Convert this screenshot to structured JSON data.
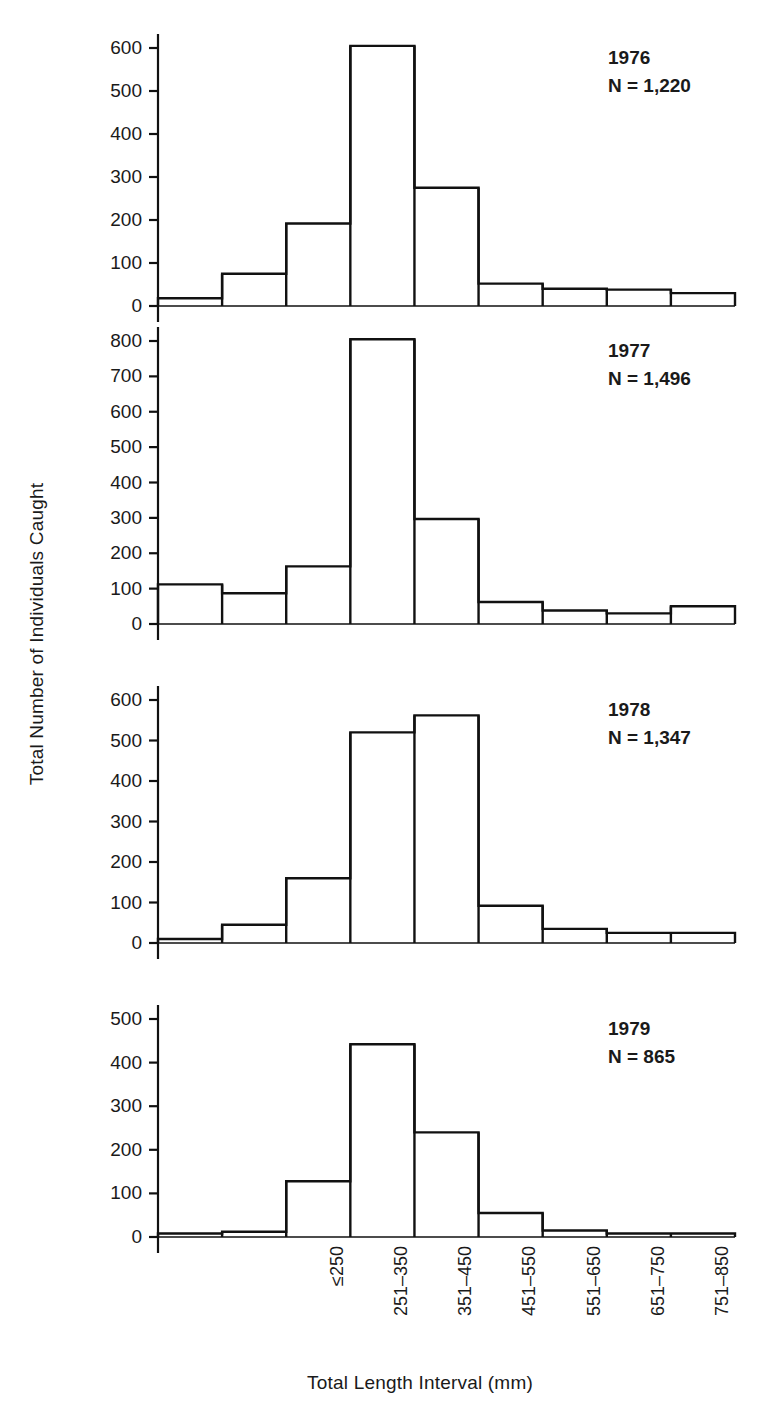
{
  "figure": {
    "xlabel": "Total Length Interval (mm)",
    "ylabel": "Total Number of Individuals Caught",
    "background": "#ffffff",
    "line_color": "#111111"
  },
  "chart_data": {
    "type": "bar",
    "title": "",
    "xlabel": "Total Length Interval (mm)",
    "ylabel": "Total Number of Individuals Caught",
    "grid": false,
    "legend": "none",
    "categories": [
      "≤250",
      "251–350",
      "351–450",
      "451–550",
      "551–650",
      "651–750",
      "751–850",
      "851–950",
      "≥951"
    ],
    "panels": [
      {
        "year": "1976",
        "n_label": "N = 1,220",
        "values": [
          18,
          75,
          192,
          605,
          275,
          52,
          40,
          38,
          30
        ],
        "ylim": [
          0,
          640
        ],
        "yticks": [
          0,
          100,
          200,
          300,
          400,
          500,
          600
        ],
        "ytick_labels": [
          "0",
          "100",
          "200",
          "300",
          "400",
          "500",
          "600"
        ]
      },
      {
        "year": "1977",
        "n_label": "N = 1,496",
        "values": [
          112,
          87,
          163,
          805,
          297,
          62,
          38,
          30,
          50
        ],
        "ylim": [
          0,
          850
        ],
        "yticks": [
          0,
          100,
          200,
          300,
          400,
          500,
          600,
          700,
          800
        ],
        "ytick_labels": [
          "0",
          "100",
          "200",
          "300",
          "400",
          "500",
          "600",
          "700",
          "800"
        ]
      },
      {
        "year": "1978",
        "n_label": "N = 1,347",
        "values": [
          10,
          45,
          160,
          520,
          562,
          92,
          35,
          25,
          25
        ],
        "ylim": [
          0,
          640
        ],
        "yticks": [
          0,
          100,
          200,
          300,
          400,
          500,
          600
        ],
        "ytick_labels": [
          "0",
          "100",
          "200",
          "300",
          "400",
          "500",
          "600"
        ]
      },
      {
        "year": "1979",
        "n_label": "N = 865",
        "values": [
          8,
          12,
          128,
          442,
          240,
          55,
          15,
          8,
          8
        ],
        "ylim": [
          0,
          535
        ],
        "yticks": [
          0,
          100,
          200,
          300,
          400,
          500
        ],
        "ytick_labels": [
          "0",
          "100",
          "200",
          "300",
          "400",
          "500"
        ]
      }
    ]
  }
}
